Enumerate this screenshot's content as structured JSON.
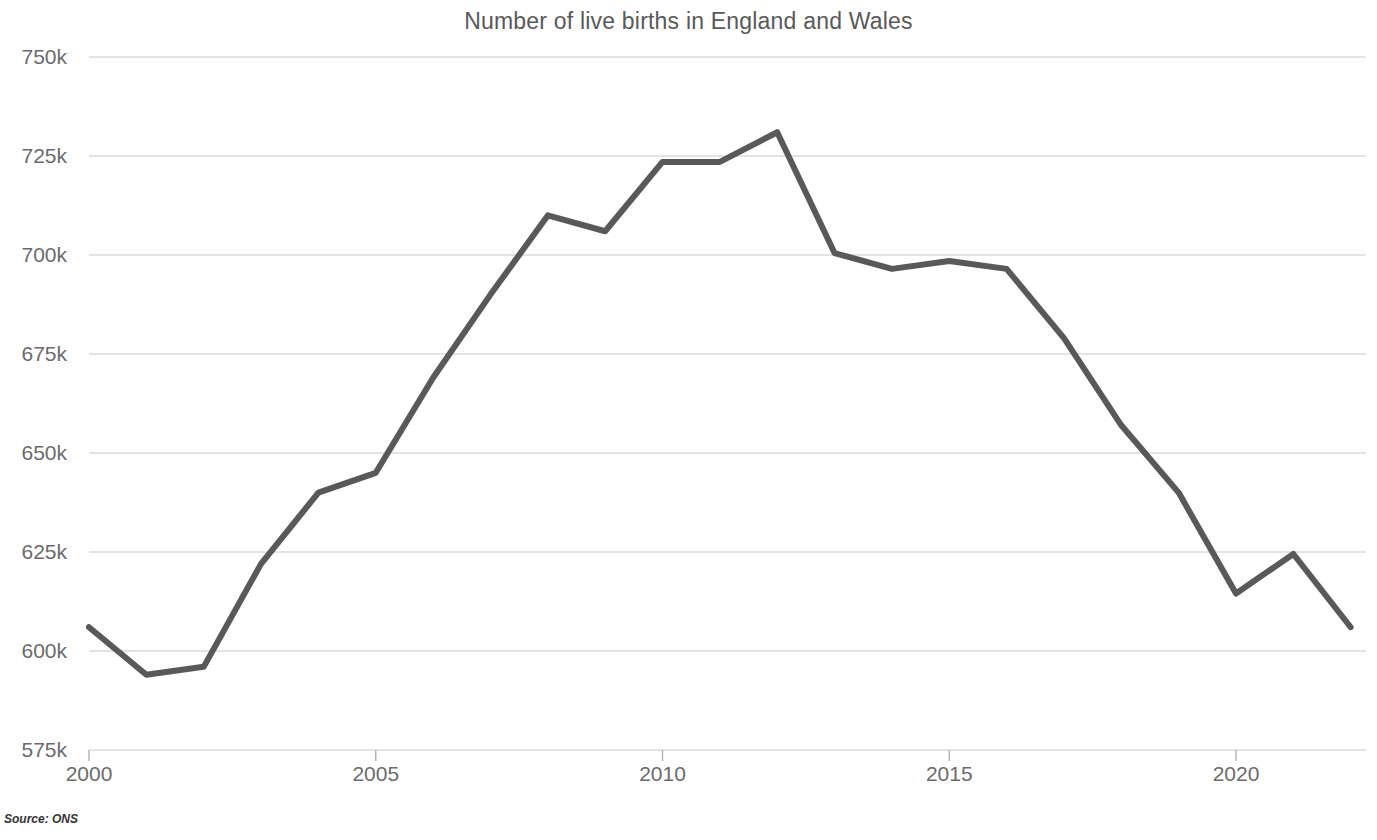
{
  "chart_data": {
    "type": "line",
    "title": "Number of live births in England and Wales",
    "xlabel": "",
    "ylabel": "",
    "source": "Source: ONS",
    "grid": "horizontal",
    "legend": "none",
    "xlim": [
      2000,
      2022
    ],
    "ylim": [
      575000,
      750000
    ],
    "y_tick_labels": [
      "750k",
      "725k",
      "700k",
      "675k",
      "650k",
      "625k",
      "600k",
      "575k"
    ],
    "y_tick_values": [
      750000,
      725000,
      700000,
      675000,
      650000,
      625000,
      600000,
      575000
    ],
    "x_tick_labels": [
      "2000",
      "2005",
      "2010",
      "2015",
      "2020"
    ],
    "x_tick_values": [
      2000,
      2005,
      2010,
      2015,
      2020
    ],
    "series": [
      {
        "name": "Live births",
        "color": "#595959",
        "line_width": 6,
        "x": [
          2000,
          2001,
          2002,
          2003,
          2004,
          2005,
          2006,
          2007,
          2008,
          2009,
          2010,
          2011,
          2012,
          2013,
          2014,
          2015,
          2016,
          2017,
          2018,
          2019,
          2020,
          2021,
          2022
        ],
        "values": [
          606000,
          594000,
          596000,
          622000,
          640000,
          645000,
          669000,
          690000,
          710000,
          706000,
          723500,
          723500,
          731000,
          700500,
          696500,
          698500,
          696500,
          679000,
          657000,
          640000,
          614500,
          624500,
          606000
        ]
      }
    ]
  },
  "colors": {
    "line": "#595959",
    "gridline": "#c8c8c8",
    "tick_label": "#6b6b6b",
    "title": "#595959",
    "background": "#ffffff"
  }
}
